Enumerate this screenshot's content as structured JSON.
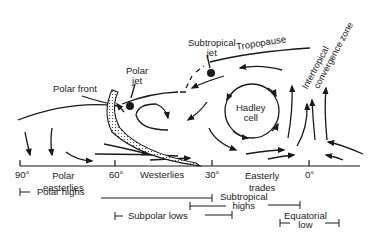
{
  "diagram": {
    "title": "",
    "type": "atmospheric-general-circulation",
    "labels": {
      "subtropical_jet": [
        "Subtropical",
        "jet"
      ],
      "tropopause": "Tropopause",
      "polar_jet": [
        "Polar",
        "jet"
      ],
      "polar_front": "Polar front",
      "hadley_cell": [
        "Hadley",
        "cell"
      ],
      "itcz": [
        "Intertropical",
        "convergence zone"
      ]
    },
    "axis": {
      "ticks": [
        "90°",
        "60°",
        "30°",
        "0°"
      ]
    },
    "wind_belts": {
      "polar_easterlies": [
        "Polar",
        "easterlies"
      ],
      "westerlies": "Westerlies",
      "easterly_trades": [
        "Easterly",
        "trades"
      ]
    },
    "pressure_zones": {
      "polar_highs": "Polar highs",
      "subpolar_lows": "Subpolar lows",
      "subtropical_highs": [
        "Subtropical",
        "highs"
      ],
      "equatorial_low": [
        "Equatorial",
        "low"
      ]
    },
    "colors": {
      "ink": "#1a1a1a",
      "background": "#ffffff"
    }
  }
}
